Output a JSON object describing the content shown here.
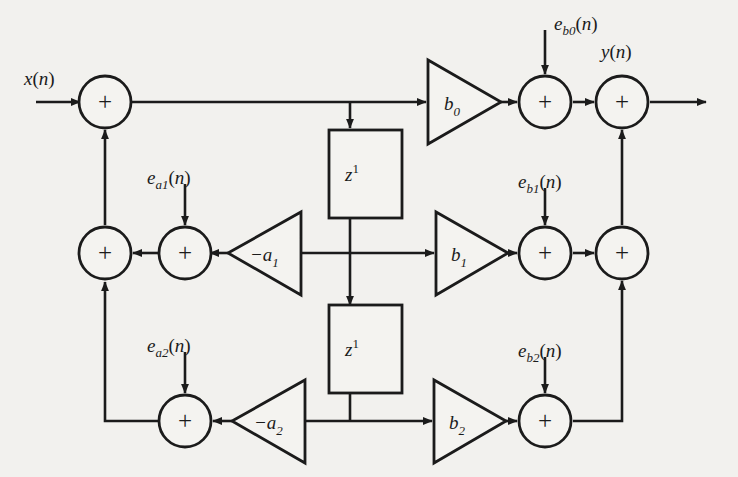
{
  "diagram": {
    "type": "signal-flow-diagram",
    "background_color": "#f2f1ee",
    "line_color": "#1b1b1b",
    "signals": {
      "input": "x(n)",
      "output": "y(n)"
    },
    "noise_sources": [
      {
        "id": "e_b0",
        "base": "e",
        "sub": "b0",
        "arg": "(n)",
        "label": "e_b0(n)"
      },
      {
        "id": "e_b1",
        "base": "e",
        "sub": "b1",
        "arg": "(n)",
        "label": "e_b1(n)"
      },
      {
        "id": "e_b2",
        "base": "e",
        "sub": "b2",
        "arg": "(n)",
        "label": "e_b2(n)"
      },
      {
        "id": "e_a1",
        "base": "e",
        "sub": "a1",
        "arg": "(n)",
        "label": "e_a1(n)"
      },
      {
        "id": "e_a2",
        "base": "e",
        "sub": "a2",
        "arg": "(n)",
        "label": "e_a2(n)"
      }
    ],
    "gains": [
      {
        "id": "b0",
        "base": "b",
        "sub": "0",
        "label": "b0",
        "direction": "right"
      },
      {
        "id": "b1",
        "base": "b",
        "sub": "1",
        "label": "b1",
        "direction": "right"
      },
      {
        "id": "b2",
        "base": "b",
        "sub": "2",
        "label": "b2",
        "direction": "right"
      },
      {
        "id": "a1",
        "base": "-a",
        "sub": "1",
        "label": "-a1",
        "direction": "left"
      },
      {
        "id": "a2",
        "base": "-a",
        "sub": "2",
        "label": "-a2",
        "direction": "left"
      }
    ],
    "delays": [
      {
        "id": "z1-top",
        "base": "z",
        "exp": "1",
        "label": "z^1"
      },
      {
        "id": "z1-bottom",
        "base": "z",
        "exp": "1",
        "label": "z^1"
      }
    ],
    "adders": [
      {
        "id": "sum-input",
        "symbol": "+"
      },
      {
        "id": "sum-a1-left",
        "symbol": "+"
      },
      {
        "id": "sum-a1-noise",
        "symbol": "+"
      },
      {
        "id": "sum-a2-noise",
        "symbol": "+"
      },
      {
        "id": "sum-b0",
        "symbol": "+"
      },
      {
        "id": "sum-output",
        "symbol": "+"
      },
      {
        "id": "sum-b1",
        "symbol": "+"
      },
      {
        "id": "sum-b1-right",
        "symbol": "+"
      },
      {
        "id": "sum-b2",
        "symbol": "+"
      }
    ]
  }
}
